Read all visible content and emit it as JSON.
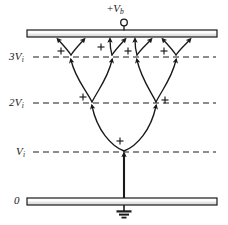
{
  "figure": {
    "title_terminal": {
      "prefix": "+",
      "symbol": "V",
      "subscript": "b",
      "full": "+Vb"
    },
    "levels": [
      {
        "id": "level-3vi",
        "label_num": "3",
        "label_sym": "V",
        "label_sub": "i",
        "text": "3Vi",
        "y": 57,
        "dashed": true
      },
      {
        "id": "level-2vi",
        "label_num": "2",
        "label_sym": "V",
        "label_sub": "i",
        "text": "2Vi",
        "y": 103,
        "dashed": true
      },
      {
        "id": "level-vi",
        "label_num": "",
        "label_sym": "V",
        "label_sub": "i",
        "text": "Vi",
        "y": 152,
        "dashed": true
      },
      {
        "id": "level-0",
        "label_num": "",
        "label_sym": "0",
        "label_sub": "",
        "text": "0",
        "y": 201,
        "dashed": false
      }
    ],
    "plates": [
      {
        "id": "top-plate",
        "x": 27,
        "y": 30,
        "w": 190,
        "h": 7
      },
      {
        "id": "bottom-plate",
        "x": 27,
        "y": 198,
        "w": 190,
        "h": 7
      }
    ],
    "terminal": {
      "cx": 124,
      "cy": 23,
      "r": 3.2,
      "stem_top": 26,
      "stem_bottom": 30
    },
    "ground": {
      "stem_x": 124,
      "stem_top": 205,
      "stem_bottom": 211,
      "bars": [
        {
          "w": 15,
          "h": 2.2,
          "y": 211
        },
        {
          "w": 10,
          "h": 2.0,
          "y": 214.5
        },
        {
          "w": 5,
          "h": 1.8,
          "y": 217.6
        }
      ]
    },
    "plus_marks": [
      {
        "x": 61,
        "y": 51
      },
      {
        "x": 101,
        "y": 47
      },
      {
        "x": 128,
        "y": 51
      },
      {
        "x": 164,
        "y": 51
      },
      {
        "x": 83,
        "y": 98
      },
      {
        "x": 164,
        "y": 101
      },
      {
        "x": 120,
        "y": 141
      }
    ],
    "nodes": {
      "start": {
        "x": 124,
        "y": 152
      },
      "level2": [
        {
          "x": 92,
          "y": 103
        },
        {
          "x": 156,
          "y": 103
        }
      ],
      "level3": [
        {
          "x": 71,
          "y": 57
        },
        {
          "x": 112,
          "y": 57
        },
        {
          "x": 137,
          "y": 57
        },
        {
          "x": 176,
          "y": 57
        }
      ]
    },
    "colors": {
      "ink": "#1a1a1a",
      "plate_face": "#f2f2f2",
      "background": "#ffffff"
    },
    "caption_alt": "Electron avalanche multiplication diagram between two plates, with ionization levels Vi, 2Vi, 3Vi"
  }
}
